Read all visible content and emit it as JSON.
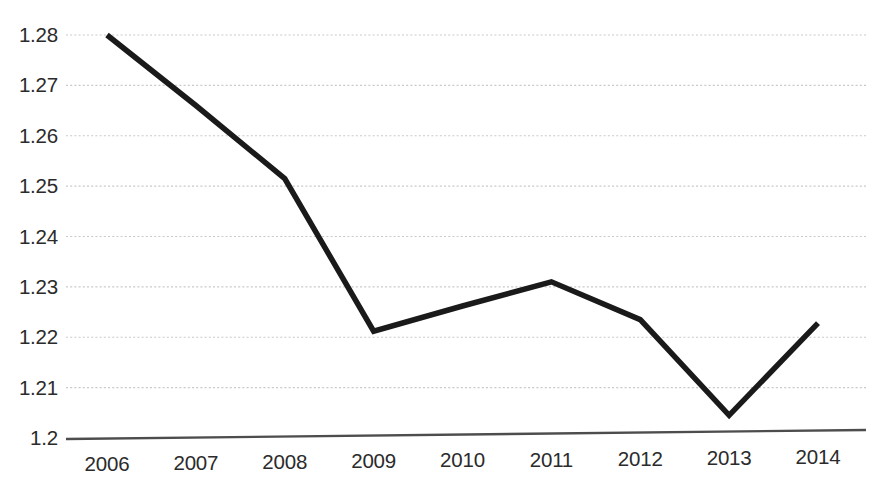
{
  "chart_data": {
    "type": "line",
    "title": "",
    "subtitle": "",
    "xlabel": "",
    "ylabel": "",
    "categories": [
      "2006",
      "2007",
      "2008",
      "2009",
      "2010",
      "2011",
      "2012",
      "2013",
      "2014"
    ],
    "x": [
      2006,
      2007,
      2008,
      2009,
      2010,
      2011,
      2012,
      2013,
      2014
    ],
    "values": [
      1.28,
      1.266,
      1.2515,
      1.2212,
      1.2262,
      1.231,
      1.2235,
      1.2045,
      1.2228
    ],
    "series": [
      {
        "name": "",
        "values": [
          1.28,
          1.266,
          1.2515,
          1.2212,
          1.2262,
          1.231,
          1.2235,
          1.2045,
          1.2228
        ]
      }
    ],
    "ylim": [
      1.2,
      1.285
    ],
    "xlim": [
      2006,
      2014
    ],
    "y_ticks": [
      1.2,
      1.21,
      1.22,
      1.23,
      1.24,
      1.25,
      1.26,
      1.27,
      1.28
    ],
    "y_tick_labels": [
      "1.2",
      "1.21",
      "1.22",
      "1.23",
      "1.24",
      "1.25",
      "1.26",
      "1.27",
      "1.28"
    ],
    "x_tick_labels": [
      "2006",
      "2007",
      "2008",
      "2009",
      "2010",
      "2011",
      "2012",
      "2013",
      "2014"
    ],
    "grid": true,
    "grid_axis": "y",
    "grid_style": "dotted",
    "grid_color": "#c9c9c9",
    "line_color": "#1a1a1a",
    "line_width": 5.5,
    "axis_color": "#4d4d4d",
    "legend": false,
    "legend_position": "none",
    "markers": false,
    "annotations": []
  },
  "axis_geometry": {
    "plot_left": 107,
    "plot_right": 818,
    "grid_right": 866,
    "baseline_y": 438,
    "top_y": 35,
    "px_per_unit": 5040,
    "value_at_top": 1.28,
    "value_at_baseline": 1.2
  }
}
